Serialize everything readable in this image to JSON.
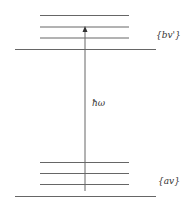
{
  "diagram": {
    "upper_manifold_label": "{bv'}",
    "lower_manifold_label": "{av}",
    "transition_label": "ħω",
    "line_color": "#555555"
  }
}
